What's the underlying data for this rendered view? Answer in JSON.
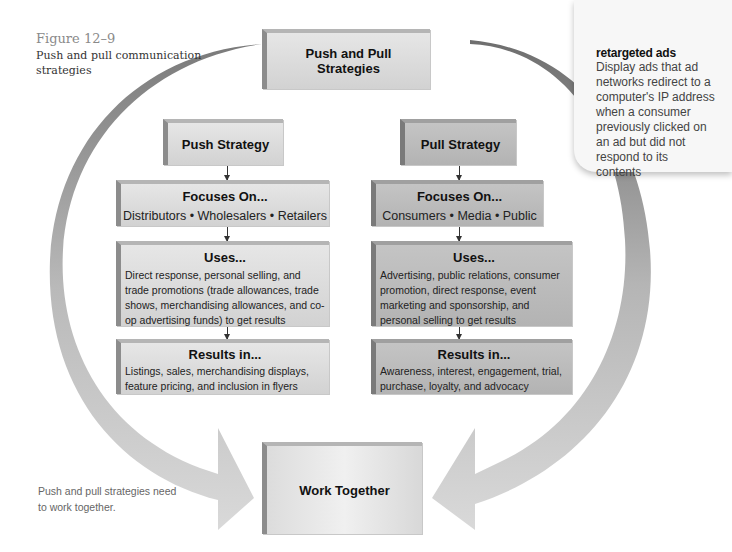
{
  "figure": {
    "number": "Figure 12–9",
    "title": "Push and pull communication strategies"
  },
  "top_box": {
    "label": "Push and Pull Strategies"
  },
  "push": {
    "title": "Push Strategy",
    "focuses_on": {
      "heading": "Focuses On...",
      "body": "Distributors • Wholesalers • Retailers"
    },
    "uses": {
      "heading": "Uses...",
      "body": "Direct response, personal selling, and trade promotions (trade allowances, trade shows, merchandising allowances, and co-op advertising funds) to get results"
    },
    "results_in": {
      "heading": "Results in...",
      "body": "Listings, sales, merchandising displays, feature pricing, and inclusion in flyers"
    }
  },
  "pull": {
    "title": "Pull Strategy",
    "focuses_on": {
      "heading": "Focuses On...",
      "body": "Consumers • Media • Public"
    },
    "uses": {
      "heading": "Uses...",
      "body": "Advertising, public relations, consumer promotion, direct response, event marketing and sponsorship, and personal selling to get results"
    },
    "results_in": {
      "heading": "Results in...",
      "body": "Awareness, interest, engagement, trial, purchase, loyalty, and advocacy"
    }
  },
  "bottom_box": {
    "label": "Work Together"
  },
  "side_caption": "Push and pull strategies need to work together.",
  "margin_note": {
    "term": "retargeted ads",
    "definition": "Display ads that ad networks redirect to a computer's IP address when a consumer previously clicked on an ad but did not respond to its contents"
  },
  "colors": {
    "box_light": "#dcdcdc",
    "box_dark": "#bdbdbd",
    "arc_dark": "#777777",
    "arc_light": "#d6d6d6",
    "caption_gray": "#8a8a8a"
  }
}
